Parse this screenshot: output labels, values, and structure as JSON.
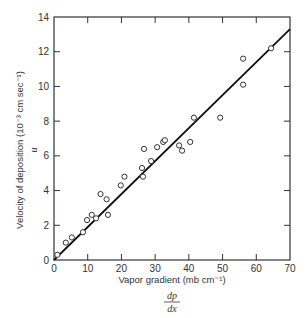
{
  "chart_data": {
    "type": "scatter",
    "title": "",
    "xlabel": "Vapor gradient (mb cm⁻¹)",
    "xlabel_symbol_num": "dp",
    "xlabel_symbol_den": "dx",
    "ylabel": "Velocity of deposition (10⁻³ cm sec⁻¹)",
    "ylabel_symbol": "u",
    "xlim": [
      0,
      70
    ],
    "ylim": [
      0,
      14
    ],
    "xticks": [
      0,
      10,
      20,
      30,
      40,
      50,
      60,
      70
    ],
    "yticks": [
      0,
      2,
      4,
      6,
      8,
      10,
      12,
      14
    ],
    "grid": false,
    "legend": null,
    "series": [
      {
        "name": "observations",
        "marker": "open-circle",
        "x": [
          1.0,
          3.5,
          5.3,
          8.6,
          9.8,
          11.2,
          12.5,
          13.8,
          15.6,
          16.0,
          19.8,
          20.9,
          26.1,
          26.4,
          26.7,
          28.8,
          30.6,
          32.4,
          32.9,
          37.1,
          38.0,
          40.4,
          41.5,
          49.3,
          56.1,
          56.1,
          64.4
        ],
        "y": [
          0.3,
          1.0,
          1.3,
          1.6,
          2.3,
          2.6,
          2.4,
          3.8,
          3.5,
          2.6,
          4.3,
          4.8,
          5.3,
          4.8,
          6.4,
          5.7,
          6.5,
          6.8,
          6.9,
          6.6,
          6.3,
          6.8,
          8.2,
          8.2,
          11.6,
          10.1,
          12.2
        ]
      },
      {
        "name": "fit line",
        "type": "line",
        "x": [
          0,
          70
        ],
        "y": [
          0,
          13.3
        ]
      }
    ]
  }
}
